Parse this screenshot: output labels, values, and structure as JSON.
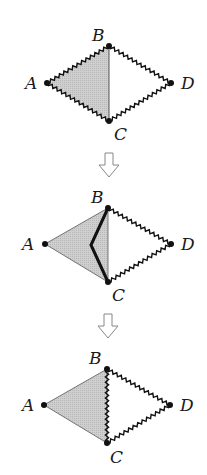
{
  "colors": {
    "fill": "#c8c8c8",
    "line": "#111111",
    "arrow": "#888888",
    "background": "#ffffff"
  },
  "arrows": [
    {
      "name": "step-arrow-1",
      "icon": "down-arrow-icon"
    },
    {
      "name": "step-arrow-2",
      "icon": "down-arrow-icon"
    }
  ],
  "panels": [
    {
      "name": "panel-1",
      "labels": {
        "A": "A",
        "B": "B",
        "C": "C",
        "D": "D"
      },
      "description": "Rhombus ABCD with wavy edges; triangle ABC shaded; BC straight thin line"
    },
    {
      "name": "panel-2",
      "labels": {
        "A": "A",
        "B": "B",
        "C": "C",
        "D": "D"
      },
      "description": "AB and AC straight; bold bent path from B to C inside shaded triangle; BD, CD wavy"
    },
    {
      "name": "panel-3",
      "labels": {
        "A": "A",
        "B": "B",
        "C": "C",
        "D": "D"
      },
      "description": "AB and AC straight; BC wavy; BD, CD wavy; triangle ABC shaded"
    }
  ]
}
